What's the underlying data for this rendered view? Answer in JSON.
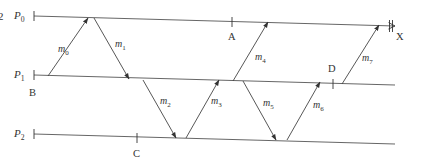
{
  "figure": {
    "number_fragment": "2",
    "processes": [
      {
        "id": "P0",
        "label_main": "P",
        "label_sub": "0",
        "x1": 34,
        "y1": 16,
        "x2": 395,
        "y2": 26
      },
      {
        "id": "P1",
        "label_main": "P",
        "label_sub": "1",
        "x1": 34,
        "y1": 75,
        "x2": 395,
        "y2": 85
      },
      {
        "id": "P2",
        "label_main": "P",
        "label_sub": "2",
        "x1": 34,
        "y1": 134,
        "x2": 395,
        "y2": 144
      }
    ],
    "messages": [
      {
        "name": "m0",
        "label_main": "m",
        "label_sub": "0",
        "x1": 48,
        "y1": 76,
        "x2": 88,
        "y2": 18,
        "lx": 58,
        "ly": 52
      },
      {
        "name": "m1",
        "label_main": "m",
        "label_sub": "1",
        "x1": 94,
        "y1": 18,
        "x2": 129,
        "y2": 79,
        "lx": 115,
        "ly": 47
      },
      {
        "name": "m2",
        "label_main": "m",
        "label_sub": "2",
        "x1": 143,
        "y1": 80,
        "x2": 176,
        "y2": 138,
        "lx": 160,
        "ly": 104
      },
      {
        "name": "m3",
        "label_main": "m",
        "label_sub": "3",
        "x1": 186,
        "y1": 138,
        "x2": 219,
        "y2": 80,
        "lx": 211,
        "ly": 104
      },
      {
        "name": "m4",
        "label_main": "m",
        "label_sub": "4",
        "x1": 233,
        "y1": 81,
        "x2": 268,
        "y2": 22,
        "lx": 255,
        "ly": 60
      },
      {
        "name": "m5",
        "label_main": "m",
        "label_sub": "5",
        "x1": 243,
        "y1": 81,
        "x2": 276,
        "y2": 140,
        "lx": 263,
        "ly": 106
      },
      {
        "name": "m6",
        "label_main": "m",
        "label_sub": "6",
        "x1": 287,
        "y1": 140,
        "x2": 320,
        "y2": 82,
        "lx": 313,
        "ly": 108
      },
      {
        "name": "m7",
        "label_main": "m",
        "label_sub": "7",
        "x1": 342,
        "y1": 84,
        "x2": 379,
        "y2": 25,
        "lx": 362,
        "ly": 61
      }
    ],
    "events": [
      {
        "name": "A",
        "label": "A",
        "x": 232,
        "y": 22,
        "lx": 228,
        "ly": 40
      },
      {
        "name": "B",
        "label": "B",
        "x": 34,
        "y": 75,
        "lx": 29,
        "ly": 96
      },
      {
        "name": "C",
        "label": "C",
        "x": 137,
        "y": 138,
        "lx": 133,
        "ly": 157
      },
      {
        "name": "D",
        "label": "D",
        "x": 333,
        "y": 84,
        "lx": 328,
        "ly": 72
      },
      {
        "name": "X",
        "label": "X",
        "x": 391,
        "y": 26,
        "lx": 396,
        "ly": 40
      }
    ]
  }
}
